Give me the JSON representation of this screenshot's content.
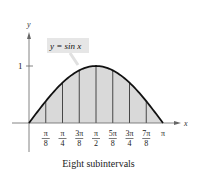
{
  "figure": {
    "function_label": "y = sin x",
    "y_axis_label": "y",
    "x_axis_label": "x",
    "y_tick_label": "1",
    "caption": "Eight subintervals",
    "x_ticks": [
      {
        "num": "π",
        "den": "8"
      },
      {
        "num": "π",
        "den": "4"
      },
      {
        "num": "3π",
        "den": "8"
      },
      {
        "num": "π",
        "den": "2"
      },
      {
        "num": "5π",
        "den": "8"
      },
      {
        "num": "3π",
        "den": "4"
      },
      {
        "num": "7π",
        "den": "8"
      },
      {
        "num": "π",
        "den": ""
      }
    ],
    "colors": {
      "fill": "#d9d9d9",
      "curve": "#111111",
      "axis": "#555555",
      "label_box": "#e6e6e6"
    }
  },
  "chart_data": {
    "type": "area",
    "title": "",
    "function": "y = sin x",
    "x": [
      0,
      0.3927,
      0.7854,
      1.1781,
      1.5708,
      1.9635,
      2.3562,
      2.7489,
      3.1416
    ],
    "values": [
      0,
      0.3827,
      0.7071,
      0.9239,
      1,
      0.9239,
      0.7071,
      0.3827,
      0
    ],
    "subintervals": 8,
    "xlabel": "x",
    "ylabel": "y",
    "xlim": [
      0,
      3.1416
    ],
    "ylim": [
      0,
      1
    ],
    "x_tick_labels": [
      "π/8",
      "π/4",
      "3π/8",
      "π/2",
      "5π/8",
      "3π/4",
      "7π/8",
      "π"
    ],
    "y_tick_labels": [
      "1"
    ],
    "caption": "Eight subintervals"
  }
}
